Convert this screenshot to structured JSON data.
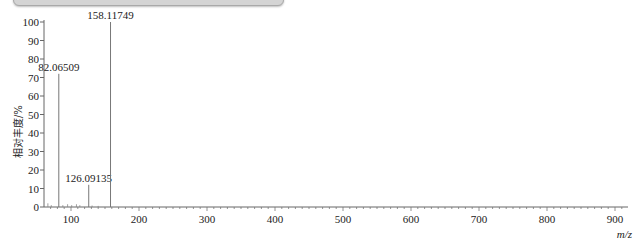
{
  "chart_data": {
    "type": "bar",
    "title": "",
    "xlabel": "m/z",
    "ylabel": "相对丰度/%",
    "xlim": [
      60,
      920
    ],
    "ylim": [
      0,
      100
    ],
    "x_ticks": [
      100,
      200,
      300,
      400,
      500,
      600,
      700,
      800,
      900
    ],
    "y_ticks": [
      0,
      10,
      20,
      30,
      40,
      50,
      60,
      70,
      80,
      90,
      100
    ],
    "grid": false,
    "legend": null,
    "peaks": [
      {
        "mz": 82.06509,
        "abundance": 72,
        "label": "82.06509"
      },
      {
        "mz": 126.09135,
        "abundance": 12,
        "label": "126.09135"
      },
      {
        "mz": 158.11749,
        "abundance": 100,
        "label": "158.11749"
      }
    ],
    "noise_peaks": [
      {
        "mz": 66,
        "abundance": 2
      },
      {
        "mz": 71,
        "abundance": 1
      },
      {
        "mz": 88,
        "abundance": 1
      },
      {
        "mz": 95,
        "abundance": 1.5
      },
      {
        "mz": 101,
        "abundance": 1
      },
      {
        "mz": 108,
        "abundance": 1.5
      },
      {
        "mz": 113,
        "abundance": 1
      },
      {
        "mz": 131,
        "abundance": 0.8
      },
      {
        "mz": 140,
        "abundance": 0.6
      }
    ]
  },
  "labels": {
    "ylabel": "相对丰度/%",
    "xlabel": "m/z"
  }
}
